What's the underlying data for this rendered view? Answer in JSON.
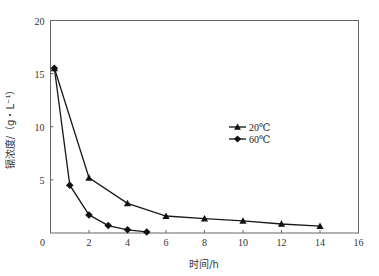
{
  "chart_data": {
    "type": "line",
    "title": "",
    "xlabel": "时间/h",
    "ylabel": "镉浓度/（g・L⁻¹）",
    "xlim": [
      0,
      16
    ],
    "ylim": [
      0,
      20
    ],
    "x_ticks": [
      0,
      2,
      4,
      6,
      8,
      10,
      12,
      14,
      16
    ],
    "y_ticks": [
      0,
      5,
      10,
      15,
      20
    ],
    "grid": false,
    "legend_position": "center-right",
    "series": [
      {
        "name": "20℃",
        "marker": "triangle",
        "x": [
          0.2,
          2,
          4,
          6,
          8,
          10,
          12,
          14
        ],
        "y": [
          15.5,
          5.2,
          2.8,
          1.6,
          1.35,
          1.15,
          0.85,
          0.65
        ]
      },
      {
        "name": "60℃",
        "marker": "diamond",
        "x": [
          0.2,
          1,
          2,
          3,
          4,
          5
        ],
        "y": [
          15.5,
          4.5,
          1.7,
          0.7,
          0.3,
          0.1
        ]
      }
    ]
  },
  "colors": {
    "line": "#1a1a1a",
    "frame": "#555555"
  }
}
